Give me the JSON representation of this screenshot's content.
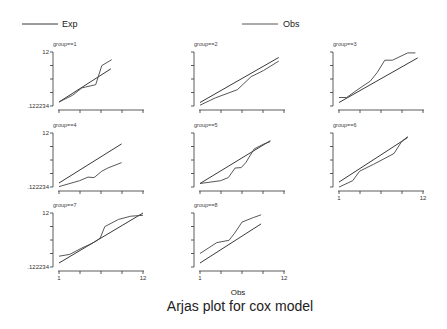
{
  "chart_data": {
    "type": "line",
    "title": "Arjas plot for cox model",
    "xlabel": "Obs",
    "ylabel": "",
    "xlim": [
      1,
      12
    ],
    "ylim": [
      0.122234,
      12
    ],
    "x_tick_labels": [
      "1",
      "12"
    ],
    "y_tick_labels": [
      ".122234",
      "12"
    ],
    "grid": false,
    "legend": {
      "position": "top",
      "entries": [
        {
          "name": "Exp"
        },
        {
          "name": "Obs"
        }
      ]
    },
    "panels": [
      {
        "title": "group==1",
        "series": [
          {
            "name": "Exp",
            "x": [
              1,
              7.8
            ],
            "y": [
              1.0,
              8.3
            ]
          },
          {
            "name": "Obs",
            "x": [
              1,
              2.8,
              4.0,
              4.5,
              5.8,
              6.6,
              7.9
            ],
            "y": [
              1.0,
              2.5,
              4.1,
              4.3,
              4.8,
              9.0,
              10.3
            ]
          }
        ]
      },
      {
        "title": "group==2",
        "series": [
          {
            "name": "Exp",
            "x": [
              1,
              11.3
            ],
            "y": [
              0.9,
              10.8
            ]
          },
          {
            "name": "Obs",
            "x": [
              1,
              3.0,
              5.9,
              7.7,
              9.3,
              11.3
            ],
            "y": [
              0.3,
              1.9,
              3.7,
              6.6,
              7.9,
              10.0
            ]
          }
        ]
      },
      {
        "title": "group==3",
        "series": [
          {
            "name": "Exp",
            "x": [
              1,
              11.3
            ],
            "y": [
              0.9,
              10.7
            ]
          },
          {
            "name": "Obs",
            "x": [
              1,
              2.0,
              3.5,
              5.1,
              6.0,
              7.0,
              8.0,
              10.0,
              11.0
            ],
            "y": [
              2.0,
              2.0,
              3.8,
              5.6,
              7.5,
              10.2,
              10.2,
              11.8,
              11.8
            ]
          }
        ]
      },
      {
        "title": "group==4",
        "series": [
          {
            "name": "Exp",
            "x": [
              1,
              9.2
            ],
            "y": [
              1.0,
              9.6
            ]
          },
          {
            "name": "Obs",
            "x": [
              1,
              3.7,
              4.8,
              5.6,
              6.6,
              7.4,
              9.2
            ],
            "y": [
              0.2,
              1.5,
              2.3,
              2.2,
              3.6,
              4.3,
              5.5
            ]
          }
        ]
      },
      {
        "title": "group==5",
        "series": [
          {
            "name": "Exp",
            "x": [
              1,
              10.2
            ],
            "y": [
              0.9,
              10.3
            ]
          },
          {
            "name": "Obs",
            "x": [
              1,
              3.7,
              4.7,
              5.6,
              6.4,
              7.0,
              8.1,
              9.4,
              10.2
            ],
            "y": [
              0.9,
              1.5,
              2.2,
              4.3,
              4.4,
              5.5,
              8.5,
              9.6,
              10.1
            ]
          }
        ]
      },
      {
        "title": "group==6",
        "series": [
          {
            "name": "Exp",
            "x": [
              1,
              10.0
            ],
            "y": [
              1.2,
              11.0
            ]
          },
          {
            "name": "Obs",
            "x": [
              1,
              2.8,
              3.7,
              5.5,
              8.2,
              9.2,
              10.0
            ],
            "y": [
              0.1,
              1.5,
              3.6,
              5.1,
              7.5,
              10.1,
              11.2
            ]
          }
        ]
      },
      {
        "title": "group==7",
        "series": [
          {
            "name": "Exp",
            "x": [
              1,
              12
            ],
            "y": [
              1.0,
              12.0
            ]
          },
          {
            "name": "Obs",
            "x": [
              1,
              2.4,
              4.0,
              5.3,
              6.0,
              6.4,
              7.0,
              8.8,
              10.4,
              12.0
            ],
            "y": [
              2.5,
              2.9,
              4.3,
              5.3,
              6.0,
              6.5,
              9.0,
              10.6,
              11.3,
              11.5
            ]
          }
        ]
      },
      {
        "title": "group==8",
        "series": [
          {
            "name": "Exp",
            "x": [
              1,
              9.0
            ],
            "y": [
              1.0,
              9.6
            ]
          },
          {
            "name": "Obs",
            "x": [
              1,
              3.2,
              4.8,
              5.5,
              6.5,
              8.0,
              9.0
            ],
            "y": [
              3.1,
              5.5,
              6.0,
              7.5,
              10.0,
              11.0,
              11.6
            ]
          }
        ]
      }
    ]
  }
}
